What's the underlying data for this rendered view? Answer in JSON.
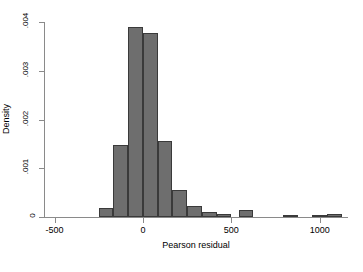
{
  "chart_data": {
    "type": "bar",
    "title": "",
    "subtitle": "",
    "xlabel": "Pearson residual",
    "ylabel": "Density",
    "grid": false,
    "legend": false,
    "legend_position": "none",
    "xlim": [
      -560,
      1160
    ],
    "ylim": [
      0,
      0.004
    ],
    "xticks": [
      -500,
      0,
      500,
      1000
    ],
    "xtick_labels": [
      "-500",
      "0",
      "500",
      "1000"
    ],
    "yticks": [
      0,
      0.001,
      0.002,
      0.003,
      0.004
    ],
    "ytick_labels": [
      "0",
      ".001",
      ".002",
      ".003",
      ".004"
    ],
    "bin_width": 83.3,
    "bar_color": "#6e6e6e",
    "bar_edge_color": "#3a3a3a",
    "axis_color": "#8a8a8a",
    "background_color": "#ffffff",
    "bins": [
      {
        "x0": -250,
        "x1": -167,
        "center": -208,
        "density": 0.00018
      },
      {
        "x0": -167,
        "x1": -83,
        "center": -125,
        "density": 0.00147
      },
      {
        "x0": -83,
        "x1": 0,
        "center": -42,
        "density": 0.00389
      },
      {
        "x0": 0,
        "x1": 83,
        "center": 42,
        "density": 0.00378
      },
      {
        "x0": 83,
        "x1": 167,
        "center": 125,
        "density": 0.00155
      },
      {
        "x0": 167,
        "x1": 250,
        "center": 208,
        "density": 0.00055
      },
      {
        "x0": 250,
        "x1": 333,
        "center": 292,
        "density": 0.00022
      },
      {
        "x0": 333,
        "x1": 417,
        "center": 375,
        "density": 0.00011
      },
      {
        "x0": 417,
        "x1": 500,
        "center": 458,
        "density": 7e-05
      },
      {
        "x0": 542,
        "x1": 625,
        "center": 583,
        "density": 0.00015
      },
      {
        "x0": 792,
        "x1": 875,
        "center": 833,
        "density": 4e-05
      },
      {
        "x0": 958,
        "x1": 1042,
        "center": 1000,
        "density": 3e-05
      },
      {
        "x0": 1042,
        "x1": 1125,
        "center": 1083,
        "density": 6e-05
      }
    ],
    "categories": [
      "-208",
      "-125",
      "-42",
      "42",
      "125",
      "208",
      "292",
      "375",
      "458",
      "583",
      "833",
      "1000",
      "1083"
    ],
    "values": [
      0.00018,
      0.00147,
      0.00389,
      0.00378,
      0.00155,
      0.00055,
      0.00022,
      0.00011,
      7e-05,
      0.00015,
      4e-05,
      3e-05,
      6e-05
    ]
  }
}
